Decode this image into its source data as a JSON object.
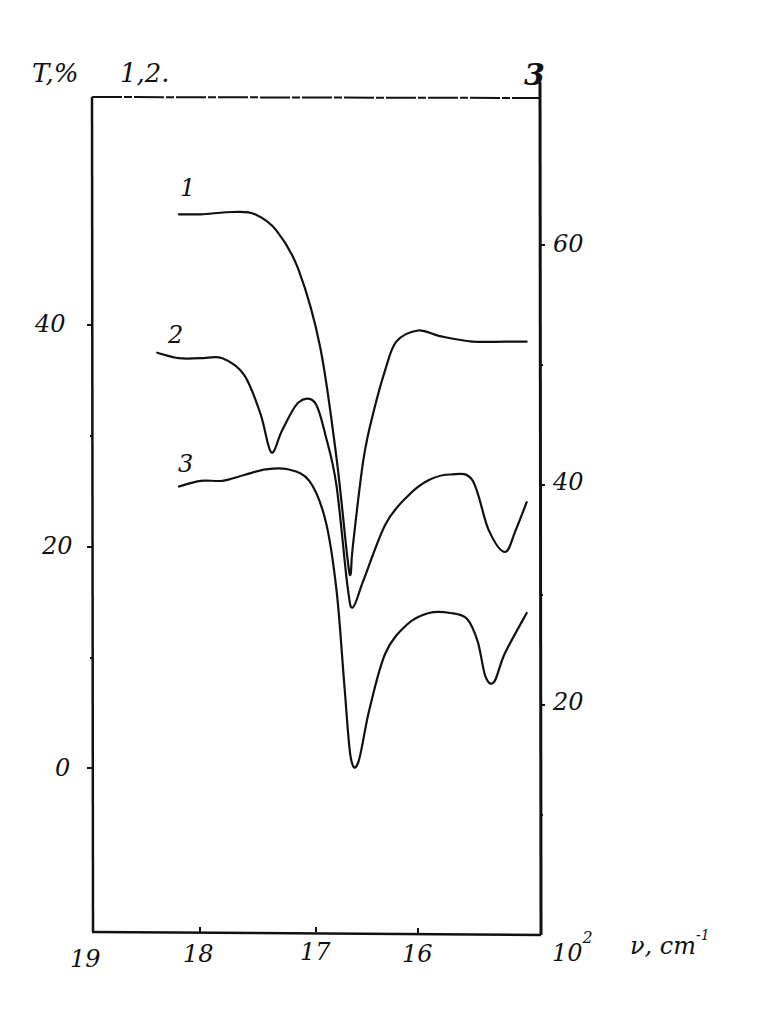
{
  "figure": {
    "panel_label": "3",
    "left_axis_title": "T,%",
    "left_axis_series_note": "1,2.",
    "x_axis_unit": "10",
    "x_axis_exponent": "2",
    "x_axis_symbol": "ν, cm",
    "x_axis_symbol_exponent": "-1",
    "x_ticks": [
      "19",
      "18",
      "17",
      "16"
    ],
    "left_ticks": [
      "40",
      "20",
      "0"
    ],
    "right_ticks": [
      "60",
      "40",
      "20"
    ],
    "curve_labels": [
      "1",
      "2",
      "3"
    ]
  },
  "chart_data": {
    "type": "line",
    "title": "",
    "panel": "3",
    "xlabel": "10^2 ν, cm^-1",
    "ylabel_left": "T, % (curves 1, 2)",
    "ylabel_right": "T, % (curve 3)",
    "x_ticks": [
      19,
      18,
      17,
      16
    ],
    "xlim": [
      19.0,
      14.8
    ],
    "x_direction": "decreasing",
    "ylim_left": [
      -15,
      60
    ],
    "ylim_right": [
      0,
      73
    ],
    "left_ticks": [
      0,
      20,
      40
    ],
    "right_ticks": [
      20,
      40,
      60
    ],
    "grid": false,
    "legend": "curve numbers placed at left start of each trace",
    "series": [
      {
        "name": "1",
        "axis": "left",
        "x": [
          18.2,
          18.0,
          17.7,
          17.5,
          17.3,
          17.1,
          16.9,
          16.75,
          16.65,
          16.62,
          16.6,
          16.5,
          16.4,
          16.3,
          16.2,
          16.0,
          15.8,
          15.5,
          15.2,
          15.0
        ],
        "y": [
          50.0,
          50.0,
          50.2,
          50.0,
          48.5,
          45.0,
          38.0,
          28.0,
          19.0,
          17.5,
          20.0,
          28.0,
          32.5,
          36.0,
          38.5,
          39.5,
          39.0,
          38.5,
          38.5,
          38.5
        ]
      },
      {
        "name": "2",
        "axis": "left",
        "x": [
          18.4,
          18.2,
          18.0,
          17.8,
          17.6,
          17.45,
          17.35,
          17.25,
          17.1,
          16.95,
          16.85,
          16.75,
          16.65,
          16.6,
          16.5,
          16.3,
          16.1,
          15.9,
          15.7,
          15.5,
          15.35,
          15.2,
          15.1,
          15.0
        ],
        "y": [
          37.5,
          37.0,
          37.0,
          37.0,
          35.5,
          32.0,
          28.5,
          30.5,
          33.0,
          33.0,
          30.0,
          25.5,
          16.5,
          14.5,
          17.0,
          22.0,
          24.5,
          26.0,
          26.5,
          26.0,
          21.5,
          19.5,
          21.5,
          24.0
        ]
      },
      {
        "name": "3",
        "axis": "right",
        "x": [
          18.2,
          18.0,
          17.8,
          17.6,
          17.4,
          17.2,
          17.0,
          16.85,
          16.75,
          16.68,
          16.62,
          16.55,
          16.45,
          16.3,
          16.1,
          15.9,
          15.7,
          15.55,
          15.45,
          15.38,
          15.3,
          15.2,
          15.0
        ],
        "y": [
          39.0,
          39.5,
          39.5,
          40.0,
          40.5,
          40.5,
          39.5,
          36.0,
          30.0,
          22.0,
          15.5,
          15.0,
          19.5,
          24.5,
          27.0,
          28.0,
          28.0,
          27.5,
          25.5,
          22.5,
          22.0,
          24.5,
          28.0
        ]
      }
    ]
  }
}
